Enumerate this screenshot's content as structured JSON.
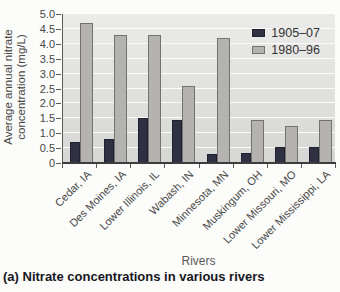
{
  "figure": {
    "caption": "(a) Nitrate concentrations in various rivers"
  },
  "chart_data": {
    "type": "bar",
    "title": "",
    "xlabel": "Rivers",
    "ylabel": "Average annual nitrate\nconcentration (mg/L)",
    "categories": [
      "Cedar, IA",
      "Des Moines, IA",
      "Lower Illinois, IL",
      "Wabash, IN",
      "Minnesota, MN",
      "Muskingum, OH",
      "Lower Missouri, MO",
      "Lower Mississippi, LA"
    ],
    "series": [
      {
        "name": "1905–07",
        "color": "#2f3042",
        "border": "#1f2030",
        "values": [
          0.7,
          0.8,
          1.5,
          1.45,
          0.3,
          0.35,
          0.55,
          0.55
        ]
      },
      {
        "name": "1980–96",
        "color": "#b4b3b1",
        "border": "#73726f",
        "values": [
          4.7,
          4.3,
          4.3,
          2.6,
          4.2,
          1.45,
          1.25,
          1.45
        ]
      }
    ],
    "ylim": [
      0,
      5.0
    ],
    "ytick_step": 0.5,
    "yticks": [
      "0",
      "0.5",
      "1.0",
      "1.5",
      "2.0",
      "2.5",
      "3.0",
      "3.5",
      "4.0",
      "4.5",
      "5.0"
    ],
    "grid": true,
    "legend_position": "top-right",
    "plot_background": "#e3e3e1",
    "gridline_color": "#ffffff"
  }
}
